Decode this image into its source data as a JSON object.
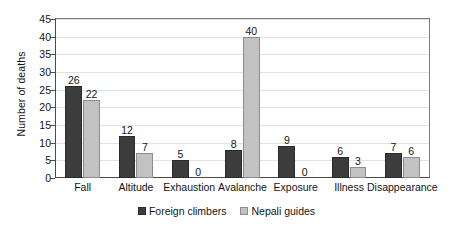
{
  "chart_data": {
    "type": "bar",
    "title": "",
    "subtitle": "",
    "xlabel": "",
    "ylabel": "Number of deaths",
    "ylim": [
      0,
      45
    ],
    "ytick_step": 5,
    "yticks": [
      0,
      5,
      10,
      15,
      20,
      25,
      30,
      35,
      40,
      45
    ],
    "grid": true,
    "grid_axis": "y",
    "legend_position": "bottom-center",
    "categories": [
      "Fall",
      "Altitude",
      "Exhaustion",
      "Avalanche",
      "Exposure",
      "Illness",
      "Disappearance"
    ],
    "series": [
      {
        "name": "Foreign climbers",
        "color": "#3c3c3c",
        "values": [
          26,
          12,
          5,
          8,
          9,
          6,
          7
        ]
      },
      {
        "name": "Nepali guides",
        "color": "#c2c2c2",
        "values": [
          22,
          7,
          0,
          40,
          0,
          3,
          6
        ]
      }
    ],
    "data_labels": [
      [
        "26",
        "22"
      ],
      [
        "12",
        "7"
      ],
      [
        "5",
        "0"
      ],
      [
        "8",
        "40"
      ],
      [
        "9",
        "0"
      ],
      [
        "6",
        "3"
      ],
      [
        "7",
        "6"
      ]
    ]
  },
  "legend": {
    "items": [
      {
        "label": "Foreign climbers",
        "color": "#3c3c3c"
      },
      {
        "label": "Nepali guides",
        "color": "#c2c2c2"
      }
    ]
  },
  "colors": {
    "series_foreign": "#3c3c3c",
    "series_nepali": "#c2c2c2",
    "axis": "#4a4a4a",
    "grid": "#e2e2e2",
    "text": "#141414",
    "background": "#ffffff"
  }
}
